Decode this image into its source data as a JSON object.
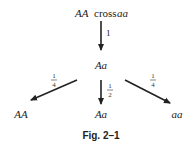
{
  "diagram": {
    "parents": {
      "left": "AA",
      "operator": "cross",
      "right": "aa"
    },
    "cross_arrow_label": "1",
    "f1": "Aa",
    "offspring": [
      {
        "genotype": "AA",
        "ratio_num": "1",
        "ratio_den": "4"
      },
      {
        "genotype": "Aa",
        "ratio_num": "1",
        "ratio_den": "2"
      },
      {
        "genotype": "aa",
        "ratio_num": "1",
        "ratio_den": "4"
      }
    ],
    "caption": "Fig. 2–1",
    "colors": {
      "ink": "#222222",
      "background": "#ffffff"
    }
  }
}
